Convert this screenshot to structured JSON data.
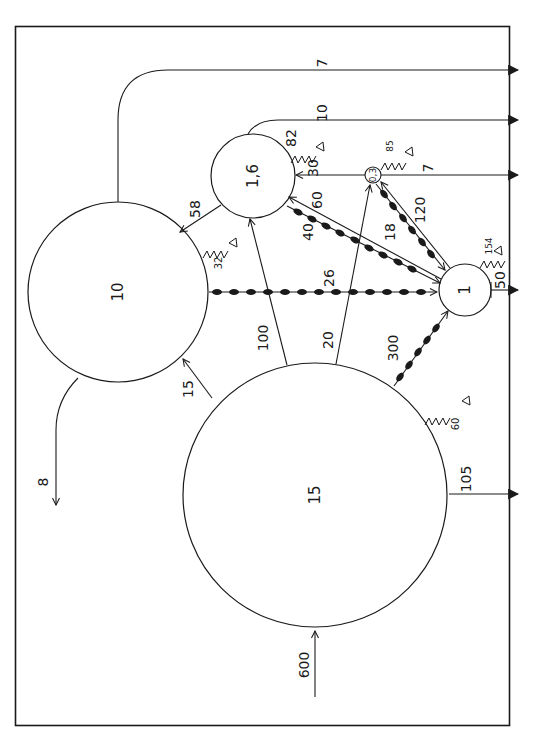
{
  "diagram": {
    "orientation": "rotated-90-clockwise",
    "nodes": [
      {
        "id": "n15",
        "label": "15",
        "cx": 315,
        "cy": 495,
        "r": 132
      },
      {
        "id": "n10",
        "label": "10",
        "cx": 118,
        "cy": 292,
        "r": 90
      },
      {
        "id": "n16",
        "label": "1,6",
        "cx": 253,
        "cy": 176,
        "r": 42
      },
      {
        "id": "n03",
        "label": "0,3",
        "cx": 373,
        "cy": 175,
        "r": 8
      },
      {
        "id": "n1",
        "label": "1",
        "cx": 465,
        "cy": 290,
        "r": 26
      }
    ],
    "flows": [
      {
        "id": "f600",
        "label": "600",
        "from": "external",
        "to": "n15",
        "style": "plain"
      },
      {
        "id": "f105",
        "label": "105",
        "from": "n15",
        "to": "export",
        "style": "export"
      },
      {
        "id": "f15",
        "label": "15",
        "from": "n15",
        "to": "n10",
        "style": "plain"
      },
      {
        "id": "f100",
        "label": "100",
        "from": "n15",
        "to": "n16",
        "style": "plain"
      },
      {
        "id": "f20",
        "label": "20",
        "from": "n15",
        "to": "n03",
        "style": "plain"
      },
      {
        "id": "f300",
        "label": "300",
        "from": "n15",
        "to": "n1",
        "style": "beaded"
      },
      {
        "id": "f8",
        "label": "8",
        "from": "n10",
        "to": "external",
        "style": "plain"
      },
      {
        "id": "f7a",
        "label": "7",
        "from": "n10",
        "to": "export",
        "style": "export"
      },
      {
        "id": "f26",
        "label": "26",
        "from": "n10",
        "to": "n1",
        "style": "beaded"
      },
      {
        "id": "f58",
        "label": "58",
        "from": "n16",
        "to": "n10",
        "style": "plain"
      },
      {
        "id": "f10",
        "label": "10",
        "from": "n16",
        "to": "export",
        "style": "export"
      },
      {
        "id": "f40",
        "label": "40",
        "from": "n16",
        "to": "n1",
        "style": "beaded"
      },
      {
        "id": "f60",
        "label": "60",
        "from": "n1",
        "to": "n16",
        "style": "plain"
      },
      {
        "id": "f30",
        "label": "30",
        "from": "n03",
        "to": "n16",
        "style": "plain"
      },
      {
        "id": "f7b",
        "label": "7",
        "from": "n03",
        "to": "export",
        "style": "export"
      },
      {
        "id": "f18",
        "label": "18",
        "from": "n03",
        "to": "n1",
        "style": "beaded"
      },
      {
        "id": "f120",
        "label": "120",
        "from": "n1",
        "to": "n03",
        "style": "plain"
      },
      {
        "id": "f50",
        "label": "50",
        "from": "n1",
        "to": "export",
        "style": "export"
      }
    ],
    "respiration": [
      {
        "id": "r60",
        "label": "60",
        "node": "n15"
      },
      {
        "id": "r32",
        "label": "32",
        "node": "n10"
      },
      {
        "id": "r82",
        "label": "82",
        "node": "n16"
      },
      {
        "id": "r85",
        "label": "85",
        "node": "n03"
      },
      {
        "id": "r154",
        "label": "154",
        "node": "n1"
      }
    ]
  },
  "labels": {
    "n15": "15",
    "n10": "10",
    "n16": "1,6",
    "n03": "0,3",
    "n1": "1",
    "f600": "600",
    "f105": "105",
    "f15": "15",
    "f100": "100",
    "f20": "20",
    "f300": "300",
    "f8": "8",
    "f7a": "7",
    "f26": "26",
    "f58": "58",
    "f10": "10",
    "f40": "40",
    "f60": "60",
    "f30": "30",
    "f7b": "7",
    "f18": "18",
    "f120": "120",
    "f50": "50",
    "r60": "60",
    "r32": "32",
    "r82": "82",
    "r85": "85",
    "r154": "154"
  },
  "colors": {
    "ink": "#1a1a1a",
    "background": "#ffffff"
  }
}
